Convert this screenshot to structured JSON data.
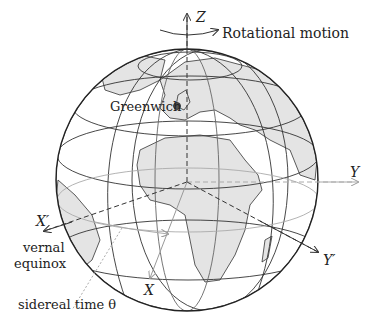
{
  "diagram": {
    "labels": {
      "z_axis": "Z",
      "rotation": "Rotational motion",
      "greenwich": "Greenwich",
      "y_axis": "Y",
      "x_prime": "X′",
      "vernal": "vernal",
      "equinox": "equinox",
      "y_prime": "Y′",
      "x_axis": "X",
      "sidereal": "sidereal time θ"
    },
    "colors": {
      "land": "#e4e4e4",
      "lines": "#333333",
      "light_lines": "#aaaaaa",
      "background": "#ffffff"
    }
  }
}
